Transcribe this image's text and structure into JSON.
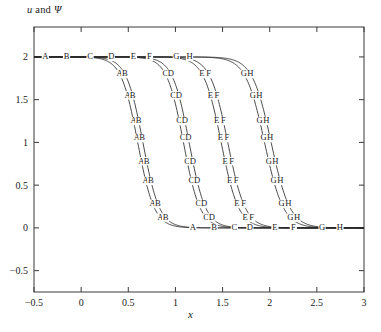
{
  "chart_data": {
    "type": "line",
    "title": "",
    "ylabel": "u and Ψ",
    "xlabel": "x",
    "xlim": [
      -0.5,
      3
    ],
    "ylim": [
      -0.75,
      2.35
    ],
    "xticks": [
      -0.5,
      0,
      0.5,
      1,
      1.5,
      2,
      2.5,
      3
    ],
    "xticklabels": [
      "−0.5",
      "0",
      "0.5",
      "1",
      "1.5",
      "2",
      "2.5",
      "3"
    ],
    "yticks": [
      -0.5,
      0,
      0.5,
      1,
      1.5,
      2
    ],
    "yticklabels": [
      "−0.5",
      "0",
      "0.5",
      "1",
      "1.5",
      "2"
    ],
    "grid": false,
    "legend": "none",
    "plateau_high": 2,
    "plateau_low": 0,
    "series": [
      {
        "name": "A",
        "marker": "A",
        "center": 0.6,
        "width": 0.175,
        "amplitude": 2,
        "baseline": 0
      },
      {
        "name": "B",
        "marker": "B",
        "center": 0.655,
        "width": 0.175,
        "amplitude": 2,
        "baseline": 0
      },
      {
        "name": "C",
        "marker": "C",
        "center": 1.085,
        "width": 0.175,
        "amplitude": 2,
        "baseline": 0
      },
      {
        "name": "D",
        "marker": "D",
        "center": 1.145,
        "width": 0.175,
        "amplitude": 2,
        "baseline": 0
      },
      {
        "name": "E",
        "marker": "E",
        "center": 1.485,
        "width": 0.185,
        "amplitude": 2,
        "baseline": 0
      },
      {
        "name": "F",
        "marker": "F",
        "center": 1.555,
        "width": 0.185,
        "amplitude": 2,
        "baseline": 0
      },
      {
        "name": "G",
        "marker": "G",
        "center": 1.945,
        "width": 0.2,
        "amplitude": 2,
        "baseline": 0
      },
      {
        "name": "H",
        "marker": "H",
        "center": 2.015,
        "width": 0.2,
        "amplitude": 2,
        "baseline": 0
      }
    ],
    "marker_labels_top": [
      "A",
      "B",
      "C",
      "D",
      "E",
      "F",
      "G",
      "H"
    ],
    "marker_labels_bottom": [
      "A",
      "B",
      "C",
      "D",
      "E",
      "F",
      "G",
      "H"
    ],
    "top_marker_x": [
      -0.38,
      -0.155,
      0.095,
      0.32,
      0.555,
      0.725,
      1.01,
      1.15
    ],
    "bottom_marker_x": [
      1.185,
      1.41,
      1.625,
      1.79,
      2.055,
      2.25,
      2.555,
      2.745
    ]
  }
}
